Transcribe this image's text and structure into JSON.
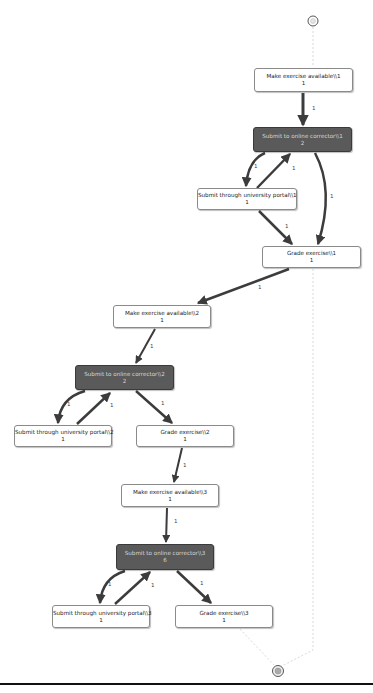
{
  "diagram": {
    "type": "process-map",
    "start_node": {
      "symbol": "start",
      "x": 313,
      "y": 21
    },
    "end_node": {
      "symbol": "end",
      "x": 278,
      "y": 671
    },
    "nodes": [
      {
        "id": "mea1",
        "label": "Make exercise available\\\\1",
        "count": "1",
        "style": "light"
      },
      {
        "id": "soc1",
        "label": "Submit to online corrector\\\\1",
        "count": "2",
        "style": "dark"
      },
      {
        "id": "sup1",
        "label": "Submit through university portal\\\\1",
        "count": "1",
        "style": "light"
      },
      {
        "id": "ge1",
        "label": "Grade exercise\\\\1",
        "count": "1",
        "style": "light"
      },
      {
        "id": "mea2",
        "label": "Make exercise available\\\\2",
        "count": "1",
        "style": "light"
      },
      {
        "id": "soc2",
        "label": "Submit to online corrector\\\\2",
        "count": "2",
        "style": "dark"
      },
      {
        "id": "sup2",
        "label": "Submit through university portal\\\\2",
        "count": "1",
        "style": "light"
      },
      {
        "id": "ge2",
        "label": "Grade exercise\\\\2",
        "count": "1",
        "style": "light"
      },
      {
        "id": "mea3",
        "label": "Make exercise available\\\\3",
        "count": "1",
        "style": "light"
      },
      {
        "id": "soc3",
        "label": "Submit to online corrector\\\\3",
        "count": "6",
        "style": "dark"
      },
      {
        "id": "sup3",
        "label": "Submit through university portal\\\\3",
        "count": "1",
        "style": "light"
      },
      {
        "id": "ge3",
        "label": "Grade exercise\\\\3",
        "count": "1",
        "style": "light"
      }
    ],
    "edges": [
      {
        "from": "start",
        "to": "mea1",
        "label": "",
        "style": "dashed"
      },
      {
        "from": "mea1",
        "to": "soc1",
        "label": "1"
      },
      {
        "from": "soc1",
        "to": "sup1",
        "label": "1"
      },
      {
        "from": "sup1",
        "to": "soc1",
        "label": "1"
      },
      {
        "from": "soc1",
        "to": "ge1",
        "label": "1"
      },
      {
        "from": "sup1",
        "to": "ge1",
        "label": "1"
      },
      {
        "from": "ge1",
        "to": "mea2",
        "label": "1"
      },
      {
        "from": "ge1",
        "to": "end",
        "label": "",
        "style": "dashed"
      },
      {
        "from": "mea2",
        "to": "soc2",
        "label": "1"
      },
      {
        "from": "soc2",
        "to": "sup2",
        "label": "1"
      },
      {
        "from": "sup2",
        "to": "soc2",
        "label": "1"
      },
      {
        "from": "soc2",
        "to": "ge2",
        "label": "1"
      },
      {
        "from": "ge2",
        "to": "mea3",
        "label": "1"
      },
      {
        "from": "mea3",
        "to": "soc3",
        "label": "1"
      },
      {
        "from": "soc3",
        "to": "sup3",
        "label": "1"
      },
      {
        "from": "sup3",
        "to": "soc3",
        "label": "1"
      },
      {
        "from": "soc3",
        "to": "ge3",
        "label": "1"
      },
      {
        "from": "ge3",
        "to": "end",
        "label": "",
        "style": "dashed"
      }
    ],
    "colors": {
      "dark_node": "#5a5a5a",
      "light_node": "#ffffff",
      "edge": "#3c3c3c",
      "dashed_edge": "#d0d0d0"
    }
  }
}
